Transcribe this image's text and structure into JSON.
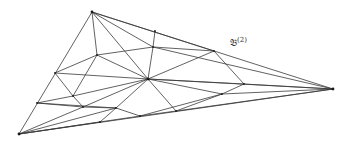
{
  "diagram": {
    "type": "triangulated-triangle",
    "label": {
      "base": "𝔅",
      "superscript": "(2)",
      "x": 230,
      "y": 36
    },
    "stroke_color": "#3a3a3a",
    "nodes": {
      "A": [
        92,
        12
      ],
      "B": [
        19,
        134
      ],
      "C": [
        333,
        89
      ],
      "H": [
        148,
        79
      ],
      "P": [
        97,
        55
      ],
      "L1": [
        55,
        73
      ],
      "L2": [
        37,
        103
      ],
      "Q": [
        73,
        96
      ],
      "R": [
        83,
        107
      ],
      "S": [
        116,
        108
      ],
      "T": [
        153,
        47
      ],
      "T0": [
        155,
        31
      ],
      "U": [
        214,
        51
      ],
      "V": [
        244,
        84
      ],
      "W": [
        222,
        94
      ],
      "X": [
        176,
        111
      ],
      "Y": [
        100,
        122
      ],
      "Z": [
        140,
        116
      ]
    },
    "edges": [
      [
        "A",
        "B"
      ],
      [
        "B",
        "C"
      ],
      [
        "A",
        "C"
      ],
      [
        "A",
        "P"
      ],
      [
        "A",
        "H"
      ],
      [
        "A",
        "T"
      ],
      [
        "A",
        "U"
      ],
      [
        "P",
        "L1"
      ],
      [
        "P",
        "H"
      ],
      [
        "P",
        "T"
      ],
      [
        "P",
        "Q"
      ],
      [
        "L1",
        "Q"
      ],
      [
        "L1",
        "H"
      ],
      [
        "T",
        "T0"
      ],
      [
        "T",
        "H"
      ],
      [
        "T",
        "U"
      ],
      [
        "T",
        "C"
      ],
      [
        "U",
        "V"
      ],
      [
        "U",
        "H"
      ],
      [
        "H",
        "V"
      ],
      [
        "H",
        "C"
      ],
      [
        "H",
        "W"
      ],
      [
        "H",
        "X"
      ],
      [
        "H",
        "S"
      ],
      [
        "H",
        "Q"
      ],
      [
        "H",
        "R"
      ],
      [
        "V",
        "C"
      ],
      [
        "V",
        "W"
      ],
      [
        "W",
        "C"
      ],
      [
        "W",
        "X"
      ],
      [
        "W",
        "Z"
      ],
      [
        "X",
        "C"
      ],
      [
        "Q",
        "R"
      ],
      [
        "Q",
        "L2"
      ],
      [
        "L2",
        "R"
      ],
      [
        "L2",
        "S"
      ],
      [
        "R",
        "S"
      ],
      [
        "R",
        "B"
      ],
      [
        "S",
        "Y"
      ],
      [
        "S",
        "Z"
      ],
      [
        "S",
        "B"
      ],
      [
        "Y",
        "B"
      ],
      [
        "Z",
        "B"
      ],
      [
        "Z",
        "X"
      ]
    ]
  }
}
